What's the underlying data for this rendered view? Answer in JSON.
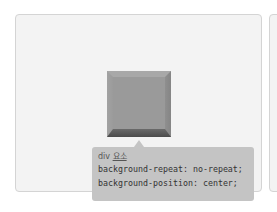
{
  "demo": {
    "element_tag": "div",
    "element_label": "요소",
    "css_lines": [
      "background-repeat: no-repeat;",
      "background-position: center;"
    ],
    "colors": {
      "panel_bg": "#f3f3f3",
      "panel_border": "#d4d4d4",
      "tooltip_bg": "#c4c4c4",
      "square_face": "#9a9a9a",
      "square_shadow": "#4b4b4b"
    }
  }
}
